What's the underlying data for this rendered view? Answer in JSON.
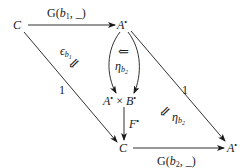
{
  "diagram": {
    "nodes": {
      "c_top": {
        "label": "C"
      },
      "a_top": {
        "label": "A",
        "sup": "•"
      },
      "a_times_b": {
        "a": "A",
        "a_sup": "•",
        "times": "×",
        "b": "B",
        "b_sup": "•"
      },
      "c_bottom": {
        "label": "C"
      },
      "a_bottom": {
        "label": "A",
        "sup": "•"
      }
    },
    "arrows": {
      "top": {
        "label_pre": "G(",
        "label_var": "b",
        "label_sub": "1",
        "label_post": ", _)"
      },
      "bottom": {
        "label_pre": "G(",
        "label_var": "b",
        "label_sub": "2",
        "label_post": ", _)"
      },
      "left_diag": {
        "label": "1"
      },
      "right_diag": {
        "label": "1"
      },
      "f_star": {
        "label": "F",
        "sup": "•"
      }
    },
    "two_cells": {
      "epsilon": {
        "symbol": "ϵ",
        "sub_var": "b",
        "sub_sub": "1",
        "arrow": "⇙"
      },
      "eta_center": {
        "symbol": "η",
        "sub_var": "b",
        "sub_sub": "2",
        "arrow": "⇐"
      },
      "eta_right": {
        "symbol": "η",
        "sub_var": "b",
        "sub_sub": "2",
        "arrow": "⇙"
      }
    }
  }
}
